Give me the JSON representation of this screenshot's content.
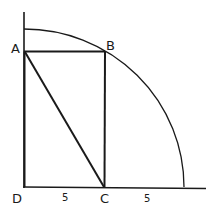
{
  "diagram": {
    "type": "geometry",
    "points": {
      "A": {
        "label": "A",
        "x": 25,
        "y": 51
      },
      "B": {
        "label": "B",
        "x": 105,
        "y": 51
      },
      "C": {
        "label": "C",
        "x": 105,
        "y": 187
      },
      "D": {
        "label": "D",
        "x": 24,
        "y": 187
      }
    },
    "segment_labels": {
      "DC": "5",
      "C_to_arc": "5"
    },
    "arc": {
      "center": "D",
      "radius": 160
    },
    "colors": {
      "stroke": "#1a1a1a",
      "background": "#ffffff"
    }
  }
}
